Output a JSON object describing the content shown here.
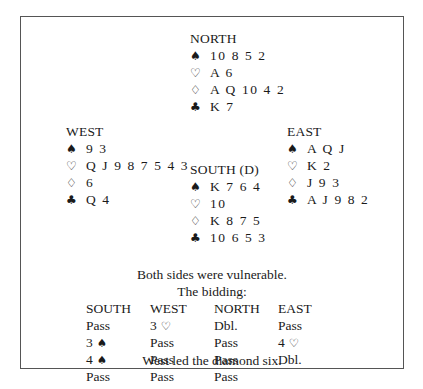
{
  "hands": {
    "north": {
      "label": "NORTH",
      "spades": "10 8 5 2",
      "hearts": "A 6",
      "diamonds": "A Q 10 4 2",
      "clubs": "K 7"
    },
    "west": {
      "label": "WEST",
      "spades": "9 3",
      "hearts": "Q J 9 8 7 5 4 3",
      "diamonds": "6",
      "clubs": "Q 4"
    },
    "east": {
      "label": "EAST",
      "spades": "A Q J",
      "hearts": "K 2",
      "diamonds": "J 9 3",
      "clubs": "A J 9 8 2"
    },
    "south": {
      "label": "SOUTH (D)",
      "spades": "K 7 6 4",
      "hearts": "10",
      "diamonds": "K 8 7 5",
      "clubs": "10 6 5 3"
    }
  },
  "suit_icons": {
    "spades": "♠",
    "hearts": "♡",
    "diamonds": "♢",
    "clubs": "♣"
  },
  "vulnerability": "Both sides were vulnerable.",
  "bidding_title": "The bidding:",
  "bidding": {
    "headers": [
      "SOUTH",
      "WEST",
      "NORTH",
      "EAST"
    ],
    "rows": [
      [
        {
          "text": "Pass",
          "suit": ""
        },
        {
          "text": "3",
          "suit": "♡"
        },
        {
          "text": "Dbl.",
          "suit": ""
        },
        {
          "text": "Pass",
          "suit": ""
        }
      ],
      [
        {
          "text": "3",
          "suit": "♠"
        },
        {
          "text": "Pass",
          "suit": ""
        },
        {
          "text": "Pass",
          "suit": ""
        },
        {
          "text": "4",
          "suit": "♡"
        }
      ],
      [
        {
          "text": "4",
          "suit": "♠"
        },
        {
          "text": "Pass",
          "suit": ""
        },
        {
          "text": "Pass",
          "suit": ""
        },
        {
          "text": "Dbl.",
          "suit": ""
        }
      ],
      [
        {
          "text": "Pass",
          "suit": ""
        },
        {
          "text": "Pass",
          "suit": ""
        },
        {
          "text": "Pass",
          "suit": ""
        },
        {
          "text": "",
          "suit": ""
        }
      ]
    ]
  },
  "opening_lead": "West led the diamond six."
}
